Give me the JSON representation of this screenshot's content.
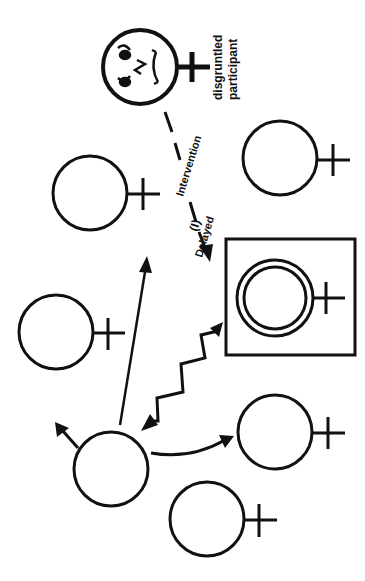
{
  "diagram": {
    "type": "group-intervention-diagram",
    "orientation": "rotated-90-ccw",
    "labels": {
      "disgruntled_line1": "disgruntled",
      "disgruntled_line2": "participant",
      "intervention_line1": "Intervention",
      "intervention_line2": "Delayed",
      "intervention_marker": "(I)"
    },
    "nodes": [
      {
        "id": "disgruntled-participant",
        "symbol": "female-symbol",
        "face": "frowning-face"
      },
      {
        "id": "participant-top-right",
        "symbol": "female-symbol"
      },
      {
        "id": "participant-upper-left",
        "symbol": "female-symbol"
      },
      {
        "id": "participant-left",
        "symbol": "female-symbol"
      },
      {
        "id": "focal-participant-boxed",
        "symbol": "female-symbol-double-circle",
        "framed": true
      },
      {
        "id": "participant-right",
        "symbol": "female-symbol"
      },
      {
        "id": "participant-bottom",
        "symbol": "female-symbol"
      },
      {
        "id": "leader",
        "symbol": "plain-circle"
      }
    ],
    "edges": [
      {
        "from": "disgruntled-participant",
        "to": "focal-participant-boxed",
        "style": "dashed-arrow",
        "label": "Delayed Intervention (I)"
      },
      {
        "from": "leader",
        "to": "participant-upper-left-area",
        "style": "solid-arrow"
      },
      {
        "from": "leader",
        "to": "focal-participant-boxed",
        "style": "zigzag-double-arrow"
      },
      {
        "from": "leader",
        "to": "participant-right",
        "style": "curved-arrow"
      },
      {
        "from": "leader",
        "to": "outside-upper-left",
        "style": "short-arrow"
      }
    ],
    "colors": {
      "stroke": "#111111",
      "background": "#ffffff"
    }
  }
}
